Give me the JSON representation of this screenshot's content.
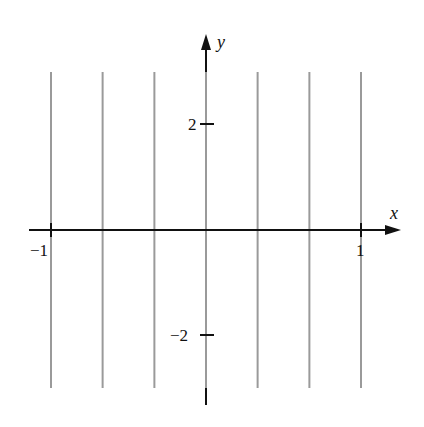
{
  "chart_data": {
    "type": "line",
    "title": "",
    "xlabel": "x",
    "ylabel": "y",
    "xlim": [
      -1.15,
      1.3
    ],
    "ylim": [
      -3.1,
      3.1
    ],
    "x_ticks": [
      {
        "value": -1,
        "label": "−1"
      },
      {
        "value": 1,
        "label": "1"
      }
    ],
    "y_ticks": [
      {
        "value": 2,
        "label": "2"
      },
      {
        "value": -2,
        "label": "−2"
      }
    ],
    "grid": false,
    "legend": null,
    "series": [
      {
        "name": "vertical line x=-1",
        "x": [
          -1,
          -1
        ],
        "y": [
          -2.8,
          2.8
        ]
      },
      {
        "name": "vertical line x=-2/3",
        "x": [
          -0.667,
          -0.667
        ],
        "y": [
          -2.8,
          2.8
        ]
      },
      {
        "name": "vertical line x=-1/3",
        "x": [
          -0.333,
          -0.333
        ],
        "y": [
          -2.8,
          2.8
        ]
      },
      {
        "name": "vertical line x=0",
        "x": [
          0,
          0
        ],
        "y": [
          -2.8,
          2.8
        ]
      },
      {
        "name": "vertical line x=1/3",
        "x": [
          0.333,
          0.333
        ],
        "y": [
          -2.8,
          2.8
        ]
      },
      {
        "name": "vertical line x=2/3",
        "x": [
          0.667,
          0.667
        ],
        "y": [
          -2.8,
          2.8
        ]
      },
      {
        "name": "vertical line x=1",
        "x": [
          1,
          1
        ],
        "y": [
          -2.8,
          2.8
        ]
      }
    ],
    "colors": {
      "lines": "#9a9a9a",
      "axes": "#111111"
    }
  }
}
